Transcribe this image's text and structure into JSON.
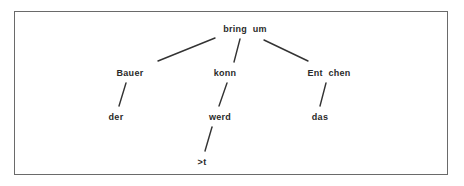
{
  "diagram": {
    "type": "dependency-tree",
    "nodes": [
      {
        "id": "root",
        "label": "bring  um",
        "x": 245,
        "y": 29
      },
      {
        "id": "bauer",
        "label": "Bauer",
        "x": 130,
        "y": 73
      },
      {
        "id": "konn",
        "label": "konn",
        "x": 225,
        "y": 73
      },
      {
        "id": "entchen",
        "label": "Ent  chen",
        "x": 329,
        "y": 73
      },
      {
        "id": "der",
        "label": "der",
        "x": 116,
        "y": 117
      },
      {
        "id": "werd",
        "label": "werd",
        "x": 220,
        "y": 117
      },
      {
        "id": "das",
        "label": "das",
        "x": 320,
        "y": 117
      },
      {
        "id": "t",
        "label": ">t",
        "x": 202,
        "y": 162
      }
    ],
    "edges": [
      {
        "from": "root",
        "to": "bauer",
        "x1": 215,
        "y1": 38,
        "x2": 158,
        "y2": 61
      },
      {
        "from": "root",
        "to": "konn",
        "x1": 240,
        "y1": 39,
        "x2": 234,
        "y2": 62
      },
      {
        "from": "root",
        "to": "entchen",
        "x1": 264,
        "y1": 40,
        "x2": 308,
        "y2": 61
      },
      {
        "from": "bauer",
        "to": "der",
        "x1": 126,
        "y1": 83,
        "x2": 119,
        "y2": 106
      },
      {
        "from": "konn",
        "to": "werd",
        "x1": 227,
        "y1": 83,
        "x2": 219,
        "y2": 106
      },
      {
        "from": "werd",
        "to": "t",
        "x1": 212,
        "y1": 127,
        "x2": 205,
        "y2": 151
      },
      {
        "from": "entchen",
        "to": "das",
        "x1": 326,
        "y1": 83,
        "x2": 320,
        "y2": 106
      }
    ]
  }
}
